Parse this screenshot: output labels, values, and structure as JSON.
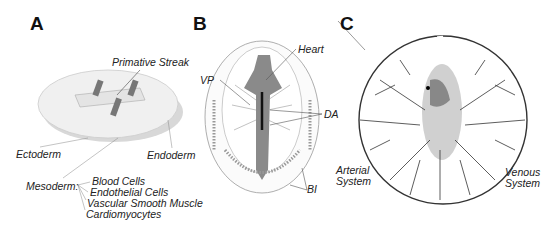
{
  "panels": [
    {
      "letter": "A",
      "labels": {
        "primitive_streak": "Primative Streak",
        "ectoderm": "Ectoderm",
        "endoderm": "Endoderm",
        "mesoderm": "Mesoderm:",
        "derivatives": [
          "Blood Cells",
          "Endothelial Cells",
          "Vascular Smooth Muscle",
          "Cardiomyocytes"
        ]
      }
    },
    {
      "letter": "B",
      "labels": {
        "heart": "Heart",
        "vp": "VP",
        "da": "DA",
        "bi": "BI"
      }
    },
    {
      "letter": "C",
      "labels": {
        "arterial_1": "Arterial",
        "arterial_2": "System",
        "venous_1": "Venous",
        "venous_2": "System"
      }
    }
  ]
}
